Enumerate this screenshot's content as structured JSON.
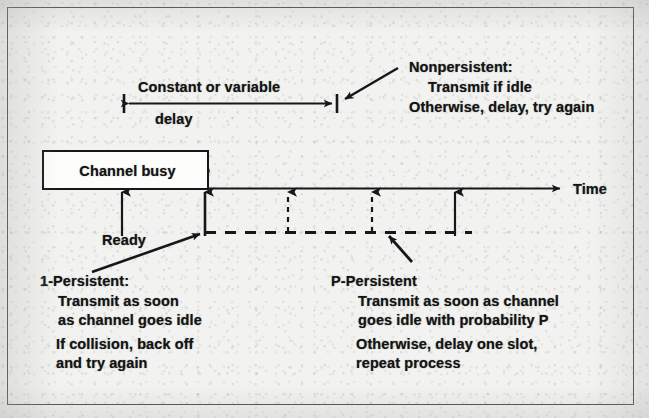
{
  "figure": {
    "type": "timing-diagram",
    "background_note": "scanned textbook page, grayscale"
  },
  "delay_annotation": {
    "line1": "Constant or variable",
    "line2": "delay",
    "arrow": "double-headed-with-end-bars",
    "span_start_x": 124,
    "span_end_x": 337
  },
  "nonpersistent": {
    "title": "Nonpersistent:",
    "lines": [
      "Transmit if idle",
      "Otherwise, delay, try again"
    ]
  },
  "channel": {
    "busy_label": "Channel busy"
  },
  "timeline": {
    "axis_label": "Time",
    "ready_label": "Ready",
    "slot_marker_count": 5,
    "slot_marker_x": [
      122,
      205,
      288,
      372,
      455
    ],
    "dashed_line_start_x": 205,
    "dashed_line_end_x": 472
  },
  "one_persistent": {
    "title": "1-Persistent:",
    "lines": [
      "Transmit as soon",
      "as channel goes idle",
      "If collision, back off",
      "and try again"
    ]
  },
  "p_persistent": {
    "title": "P-Persistent",
    "lines": [
      "Transmit as soon as channel",
      "goes idle with probability P",
      "Otherwise, delay one slot,",
      "repeat process"
    ]
  },
  "colors": {
    "ink": "#141414",
    "paper": "#f2f2f0",
    "frame": "#4a4a48",
    "box_fill": "#fdfdfc"
  }
}
